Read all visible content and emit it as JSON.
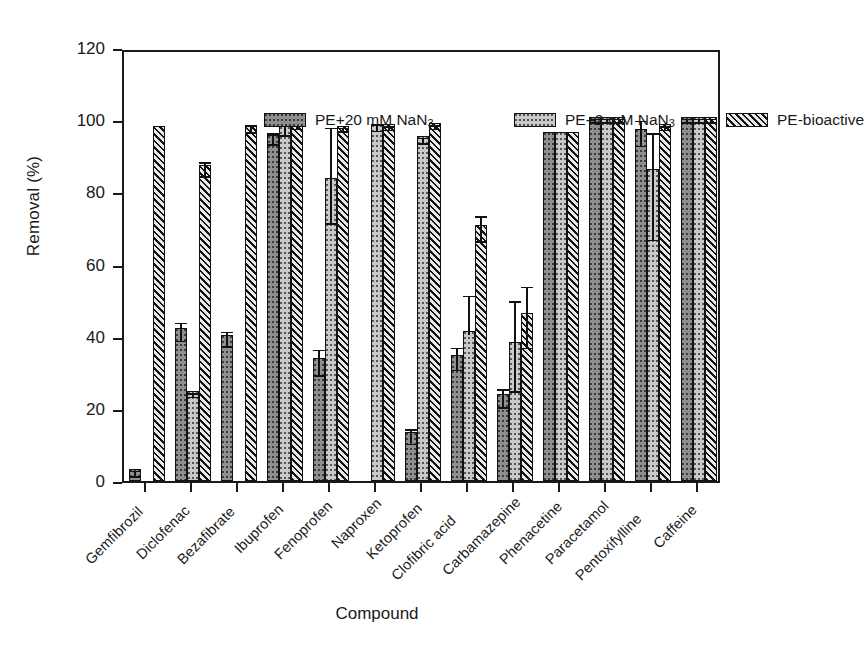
{
  "chart_data": {
    "type": "bar",
    "title": "",
    "xlabel": "Compound",
    "ylabel": "Removal (%)",
    "ylim": [
      0,
      120
    ],
    "ytick_values": [
      0,
      20,
      40,
      60,
      80,
      100,
      120
    ],
    "ytick_labels": [
      "0",
      "20",
      "40",
      "60",
      "80",
      "100",
      "120"
    ],
    "grid": false,
    "legend_position": "top-inside",
    "categories": [
      "Gemfibrozil",
      "Diclofenac",
      "Bezafibrate",
      "Ibuprofen",
      "Fenoprofen",
      "Naproxen",
      "Ketoprofen",
      "Clofibric acid",
      "Carbamazepine",
      "Phenacetine",
      "Paracetamol",
      "Pentoxifylline",
      "Caffeine"
    ],
    "series": [
      {
        "name": "PE+20 mM NaN3",
        "name_html": "PE+20 mM NaN<sub>3</sub>",
        "pattern": "dark-dotted",
        "color": "#8f8f8f",
        "values": [
          3.2,
          42.5,
          40.5,
          96.0,
          34.0,
          null,
          13.5,
          35.0,
          24.0,
          96.8,
          101.0,
          97.5,
          101.0
        ],
        "errors_up": [
          0.8,
          2.5,
          2.0,
          1.5,
          3.5,
          null,
          2.0,
          3.0,
          2.5,
          0.0,
          0.5,
          3.5,
          0.5
        ],
        "errors_down": [
          0.8,
          2.5,
          2.0,
          1.5,
          3.5,
          null,
          2.0,
          3.0,
          2.5,
          0.0,
          0.5,
          3.5,
          0.5
        ]
      },
      {
        "name": "PE+2 mM NaN3",
        "name_html": "PE+2 mM NaN<sub>3</sub>",
        "pattern": "light-dotted",
        "color": "#c9c9c9",
        "values": [
          null,
          25.0,
          null,
          98.5,
          84.0,
          99.0,
          95.5,
          41.5,
          38.5,
          96.8,
          101.0,
          86.5,
          101.0
        ],
        "errors_up": [
          null,
          0.5,
          null,
          1.5,
          15.0,
          0.8,
          0.8,
          11.0,
          12.5,
          0.0,
          0.5,
          11.0,
          0.5
        ],
        "errors_down": [
          null,
          0.5,
          null,
          1.5,
          11.5,
          0.8,
          0.8,
          0.0,
          12.5,
          0.0,
          0.5,
          18.5,
          0.5
        ]
      },
      {
        "name": "PE-bioactive",
        "name_html": "PE-bioactive",
        "pattern": "diagonal-hatch",
        "color": "#4a4a4a",
        "values": [
          98.5,
          87.5,
          98.7,
          99.2,
          98.5,
          99.0,
          99.2,
          71.0,
          46.5,
          96.8,
          101.0,
          99.0,
          101.0
        ],
        "errors_up": [
          0.0,
          2.0,
          1.0,
          0.5,
          0.5,
          0.5,
          0.5,
          3.5,
          8.5,
          0.0,
          0.5,
          0.5,
          0.5
        ],
        "errors_down": [
          0.0,
          2.0,
          1.0,
          0.5,
          0.5,
          0.5,
          0.5,
          3.5,
          8.5,
          0.0,
          0.5,
          0.5,
          0.5
        ]
      }
    ]
  },
  "axes": {
    "ylabel": "Removal (%)",
    "xlabel": "Compound"
  },
  "legend": {
    "items": [
      {
        "label": "PE+20 mM NaN",
        "sub": "3",
        "pattern": "dark-dotted"
      },
      {
        "label": "PE+2 mM NaN",
        "sub": "3",
        "pattern": "light-dotted"
      },
      {
        "label": "PE-bioactive",
        "sub": "",
        "pattern": "diagonal-hatch"
      }
    ]
  }
}
